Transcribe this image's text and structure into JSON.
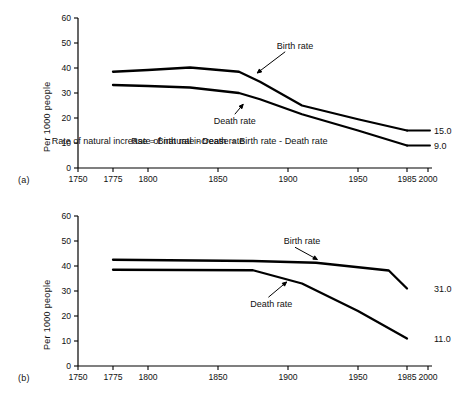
{
  "figure": {
    "background": "#ffffff",
    "line_color": "#000000",
    "panels": [
      {
        "id": "a",
        "panel_label": "(a)",
        "ylabel": "Per 1000 people",
        "annotation_formula": "Rate of natural increase = Birth rate - Death rate",
        "series_labels": {
          "birth": "Birth rate",
          "death": "Death rate"
        },
        "end_values": {
          "birth": "15.0",
          "death": "9.0"
        }
      },
      {
        "id": "b",
        "panel_label": "(b)",
        "ylabel": "Per 1000 people",
        "annotation_formula": "",
        "series_labels": {
          "birth": "Birth rate",
          "death": "Death rate"
        },
        "end_values": {
          "birth": "31.0",
          "death": "11.0"
        }
      }
    ]
  },
  "axes": {
    "y_ticks": [
      "0",
      "10",
      "20",
      "30",
      "40",
      "50",
      "60"
    ],
    "x_ticks": [
      "1750",
      "1775",
      "1800",
      "1850",
      "1900",
      "1950",
      "1985",
      "2000"
    ]
  },
  "chart_data": [
    {
      "type": "line",
      "title": "(a) Demographic transition - developed countries",
      "xlabel": "",
      "ylabel": "Per 1000 people",
      "xlim": [
        1750,
        2000
      ],
      "ylim": [
        0,
        60
      ],
      "xticks": [
        1750,
        1775,
        1800,
        1850,
        1900,
        1950,
        1985,
        2000
      ],
      "yticks": [
        0,
        10,
        20,
        30,
        40,
        50,
        60
      ],
      "grid": false,
      "legend": "inline-annotations",
      "annotations": [
        {
          "text": "Birth rate",
          "x": 1905,
          "y": 49
        },
        {
          "text": "Death rate",
          "x": 1862,
          "y": 19
        },
        {
          "text": "Rate of natural increase = Birth rate - Death rate",
          "x": 1800,
          "y": 11
        },
        {
          "text": "15.0",
          "x": 1993,
          "y": 15
        },
        {
          "text": "9.0",
          "x": 1993,
          "y": 9
        }
      ],
      "series": [
        {
          "name": "Birth rate",
          "x": [
            1775,
            1800,
            1830,
            1865,
            1880,
            1910,
            1950,
            1985
          ],
          "values": [
            38.5,
            39.2,
            40.2,
            38.5,
            34.5,
            25.0,
            19.5,
            15.0
          ]
        },
        {
          "name": "Death rate",
          "x": [
            1775,
            1800,
            1830,
            1865,
            1880,
            1910,
            1950,
            1985
          ],
          "values": [
            33.2,
            32.8,
            32.2,
            30.0,
            27.5,
            21.5,
            15.0,
            9.0
          ]
        }
      ]
    },
    {
      "type": "line",
      "title": "(b) Demographic transition - developing countries",
      "xlabel": "",
      "ylabel": "Per 1000 people",
      "xlim": [
        1750,
        2000
      ],
      "ylim": [
        0,
        60
      ],
      "xticks": [
        1750,
        1775,
        1800,
        1850,
        1900,
        1950,
        1985,
        2000
      ],
      "yticks": [
        0,
        10,
        20,
        30,
        40,
        50,
        60
      ],
      "grid": false,
      "legend": "inline-annotations",
      "annotations": [
        {
          "text": "Birth rate",
          "x": 1910,
          "y": 50
        },
        {
          "text": "Death rate",
          "x": 1888,
          "y": 25
        },
        {
          "text": "31.0",
          "x": 1993,
          "y": 31
        },
        {
          "text": "11.0",
          "x": 1993,
          "y": 11
        }
      ],
      "series": [
        {
          "name": "Birth rate",
          "x": [
            1775,
            1875,
            1920,
            1972,
            1985
          ],
          "values": [
            42.5,
            42.0,
            41.3,
            38.2,
            31.0
          ]
        },
        {
          "name": "Death rate",
          "x": [
            1775,
            1875,
            1910,
            1950,
            1985
          ],
          "values": [
            38.5,
            38.3,
            33.0,
            22.0,
            11.0
          ]
        }
      ]
    }
  ]
}
